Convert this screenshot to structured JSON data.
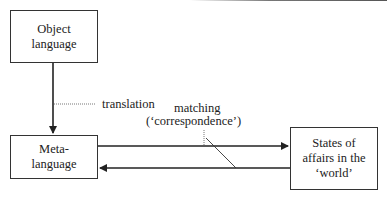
{
  "diagram": {
    "nodes": {
      "object_language": {
        "label_line1": "Object",
        "label_line2": "language"
      },
      "meta_language": {
        "label_line1": "Meta-",
        "label_line2": "language"
      },
      "states_of_affairs": {
        "label_line1": "States of",
        "label_line2": "affairs in the",
        "label_line3": "‘world’"
      }
    },
    "edges": {
      "translation": {
        "label": "translation",
        "from": "Object language",
        "to": "Meta-language"
      },
      "matching": {
        "label_line1": "matching",
        "label_line2": "(‘correspondence’)",
        "between": [
          "Meta-language",
          "States of affairs in the ‘world’"
        ]
      }
    },
    "colors": {
      "stroke": "#222222",
      "background": "#ffffff"
    }
  }
}
